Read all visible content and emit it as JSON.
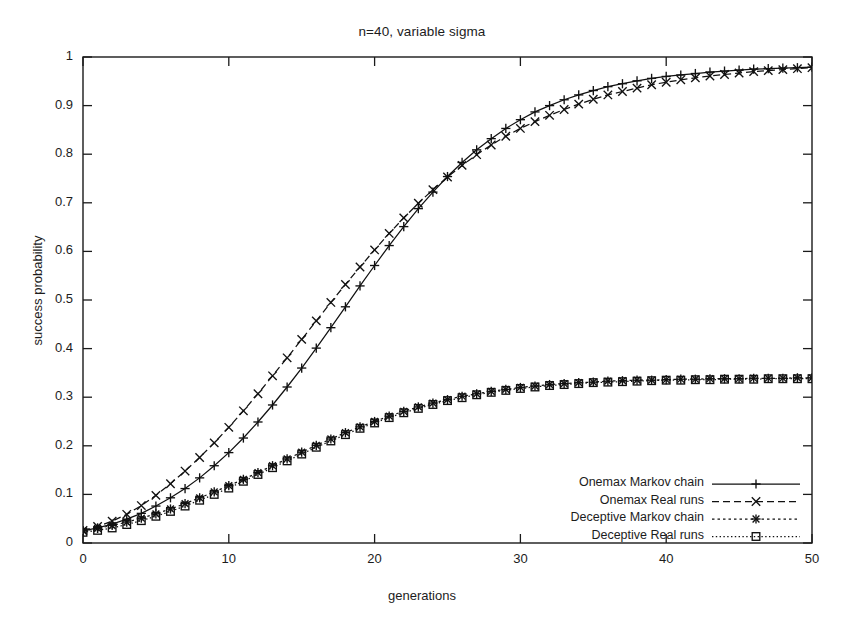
{
  "chart_data": {
    "type": "line",
    "title": "n=40, variable sigma",
    "xlabel": "generations",
    "ylabel": "success probability",
    "xlim": [
      0,
      50
    ],
    "ylim": [
      0,
      1
    ],
    "grid": false,
    "legend_position": "bottom-right",
    "xticks": [
      "0",
      "10",
      "20",
      "30",
      "40",
      "50"
    ],
    "xtick_values": [
      0,
      10,
      20,
      30,
      40,
      50
    ],
    "yticks": [
      "0",
      "0.1",
      "0.2",
      "0.3",
      "0.4",
      "0.5",
      "0.6",
      "0.7",
      "0.8",
      "0.9",
      "1"
    ],
    "ytick_values": [
      0,
      0.1,
      0.2,
      0.3,
      0.4,
      0.5,
      0.6,
      0.7,
      0.8,
      0.9,
      1
    ],
    "x": [
      0,
      1,
      2,
      3,
      4,
      5,
      6,
      7,
      8,
      9,
      10,
      11,
      12,
      13,
      14,
      15,
      16,
      17,
      18,
      19,
      20,
      21,
      22,
      23,
      24,
      25,
      26,
      27,
      28,
      29,
      30,
      31,
      32,
      33,
      34,
      35,
      36,
      37,
      38,
      39,
      40,
      41,
      42,
      43,
      44,
      45,
      46,
      47,
      48,
      49,
      50
    ],
    "series": [
      {
        "name": "Onemax Markov chain",
        "marker": "plus",
        "linestyle": "solid",
        "values": [
          0.025,
          0.031,
          0.039,
          0.049,
          0.061,
          0.076,
          0.093,
          0.112,
          0.134,
          0.159,
          0.186,
          0.216,
          0.249,
          0.284,
          0.321,
          0.36,
          0.401,
          0.443,
          0.486,
          0.529,
          0.571,
          0.612,
          0.651,
          0.688,
          0.722,
          0.754,
          0.783,
          0.809,
          0.832,
          0.853,
          0.871,
          0.887,
          0.9,
          0.912,
          0.922,
          0.931,
          0.939,
          0.945,
          0.951,
          0.956,
          0.96,
          0.963,
          0.966,
          0.969,
          0.971,
          0.973,
          0.975,
          0.976,
          0.977,
          0.978,
          0.979
        ]
      },
      {
        "name": "Onemax Real runs",
        "marker": "cross",
        "linestyle": "dashed",
        "values": [
          0.026,
          0.034,
          0.045,
          0.059,
          0.077,
          0.098,
          0.122,
          0.148,
          0.176,
          0.206,
          0.238,
          0.272,
          0.307,
          0.344,
          0.381,
          0.419,
          0.457,
          0.495,
          0.532,
          0.568,
          0.603,
          0.637,
          0.669,
          0.699,
          0.727,
          0.753,
          0.777,
          0.799,
          0.819,
          0.837,
          0.853,
          0.867,
          0.88,
          0.892,
          0.903,
          0.913,
          0.922,
          0.929,
          0.936,
          0.943,
          0.948,
          0.953,
          0.957,
          0.961,
          0.964,
          0.967,
          0.97,
          0.972,
          0.974,
          0.976,
          0.978
        ]
      },
      {
        "name": "Deceptive Markov chain",
        "marker": "star",
        "linestyle": "dotted",
        "values": [
          0.025,
          0.03,
          0.036,
          0.043,
          0.051,
          0.06,
          0.07,
          0.081,
          0.093,
          0.105,
          0.118,
          0.131,
          0.145,
          0.159,
          0.173,
          0.187,
          0.201,
          0.214,
          0.227,
          0.239,
          0.25,
          0.261,
          0.271,
          0.28,
          0.288,
          0.295,
          0.302,
          0.307,
          0.312,
          0.316,
          0.32,
          0.323,
          0.326,
          0.328,
          0.33,
          0.331,
          0.333,
          0.334,
          0.335,
          0.335,
          0.336,
          0.337,
          0.337,
          0.338,
          0.338,
          0.338,
          0.339,
          0.339,
          0.339,
          0.34,
          0.34
        ]
      },
      {
        "name": "Deceptive Real runs",
        "marker": "square",
        "linestyle": "fine-dotted",
        "values": [
          0.022,
          0.026,
          0.031,
          0.038,
          0.046,
          0.055,
          0.065,
          0.076,
          0.088,
          0.1,
          0.113,
          0.127,
          0.141,
          0.155,
          0.169,
          0.183,
          0.197,
          0.21,
          0.223,
          0.236,
          0.247,
          0.258,
          0.268,
          0.277,
          0.285,
          0.293,
          0.299,
          0.305,
          0.31,
          0.314,
          0.318,
          0.321,
          0.324,
          0.326,
          0.328,
          0.33,
          0.331,
          0.332,
          0.333,
          0.334,
          0.335,
          0.335,
          0.336,
          0.336,
          0.337,
          0.337,
          0.337,
          0.338,
          0.338,
          0.338,
          0.338
        ]
      }
    ]
  },
  "legend": {
    "items": [
      {
        "label": "Onemax Markov chain"
      },
      {
        "label": "Onemax Real runs"
      },
      {
        "label": "Deceptive Markov chain"
      },
      {
        "label": "Deceptive Real runs"
      }
    ]
  },
  "colors": {
    "axis": "#1a1a1a",
    "series": "#111111",
    "background": "#ffffff"
  }
}
